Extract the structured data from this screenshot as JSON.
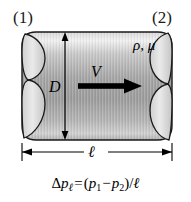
{
  "figure": {
    "background_color": "#ffffff",
    "ink_color": "#000000"
  },
  "labels": {
    "station_1": "(1)",
    "station_2": "(2)",
    "diameter": "D",
    "velocity": "V",
    "fluid_properties": "ρ, μ",
    "length": "ℓ"
  },
  "equation": {
    "full_text": "Δpℓ = (p1 − p2)/ℓ",
    "delta": "Δ",
    "p_main": "p",
    "p_main_subscript": "ℓ",
    "equals": "=",
    "open_paren": "(",
    "p_one": "p",
    "p_one_subscript": "1",
    "minus": "−",
    "p_two": "p",
    "p_two_subscript": "2",
    "close_paren": ")",
    "slash": "/",
    "denominator": "ℓ"
  },
  "pipe": {
    "fill_light": "#e9e9e9",
    "fill_mid": "#a8a8a8",
    "fill_dark": "#9a9a9a",
    "outline_color": "#1a1a1a",
    "outline_width": 1.4,
    "body_left": 22,
    "body_right": 172,
    "body_top": 32,
    "body_bottom": 140
  },
  "annotations": {
    "flow_arrow": {
      "name": "flow-direction-arrow",
      "direction": "right",
      "x_start": 78,
      "x_end": 140,
      "y": 86
    },
    "diameter_dimension": {
      "name": "diameter-dimension-line",
      "orientation": "vertical",
      "x": 65,
      "y_top": 33,
      "y_bottom": 139
    },
    "length_dimension": {
      "name": "length-dimension-line",
      "orientation": "horizontal",
      "y": 152,
      "x_left": 22,
      "x_right": 172
    }
  }
}
